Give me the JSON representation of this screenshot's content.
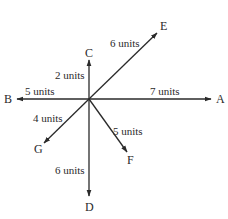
{
  "diagram": {
    "type": "vector-diagram",
    "origin": {
      "x": 89,
      "y": 99
    },
    "line_color": "#2a2a2a",
    "vectors": [
      {
        "name": "A",
        "length_label": "7 units",
        "end": {
          "x": 211,
          "y": 99
        },
        "label_pos": {
          "x": 216,
          "y": 103
        },
        "len_pos": {
          "x": 150,
          "y": 95
        }
      },
      {
        "name": "B",
        "length_label": "5 units",
        "end": {
          "x": 17,
          "y": 99
        },
        "label_pos": {
          "x": 4,
          "y": 103
        },
        "len_pos": {
          "x": 25,
          "y": 95
        }
      },
      {
        "name": "C",
        "length_label": "2 units",
        "end": {
          "x": 89,
          "y": 60
        },
        "label_pos": {
          "x": 85,
          "y": 57
        },
        "len_pos": {
          "x": 55,
          "y": 79
        }
      },
      {
        "name": "D",
        "length_label": "6 units",
        "end": {
          "x": 89,
          "y": 196
        },
        "label_pos": {
          "x": 85,
          "y": 211
        },
        "len_pos": {
          "x": 55,
          "y": 174
        }
      },
      {
        "name": "E",
        "length_label": "6 units",
        "end": {
          "x": 157,
          "y": 33
        },
        "label_pos": {
          "x": 160,
          "y": 30
        },
        "len_pos": {
          "x": 110,
          "y": 47
        }
      },
      {
        "name": "F",
        "length_label": "5 units",
        "end": {
          "x": 127,
          "y": 152
        },
        "label_pos": {
          "x": 127,
          "y": 164
        },
        "len_pos": {
          "x": 113,
          "y": 135
        }
      },
      {
        "name": "G",
        "length_label": "4 units",
        "end": {
          "x": 44,
          "y": 143
        },
        "label_pos": {
          "x": 34,
          "y": 153
        },
        "len_pos": {
          "x": 33,
          "y": 122
        }
      }
    ]
  }
}
